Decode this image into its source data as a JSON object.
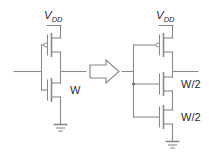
{
  "figure": {
    "type": "circuit-diagram",
    "background_color": "#ffffff",
    "wire_color": "#8a8a8a",
    "text_color": "#2b2b2b"
  },
  "left_circuit": {
    "name": "inverter-single-nmos",
    "supply_label": "V",
    "supply_subscript": "DD",
    "pmos": {
      "name": "pmos-transistor",
      "gate_bubble": true,
      "width_label": ""
    },
    "nmos": [
      {
        "name": "nmos-transistor",
        "width_label": "W"
      }
    ],
    "ground": {
      "name": "ground-symbol",
      "bars": 3
    },
    "input_terminal": "",
    "output_terminal": ""
  },
  "transform_arrow": {
    "name": "implies-arrow",
    "direction": "right",
    "style": "hollow-block"
  },
  "right_circuit": {
    "name": "inverter-stacked-nmos",
    "supply_label": "V",
    "supply_subscript": "DD",
    "pmos": {
      "name": "pmos-transistor",
      "gate_bubble": true,
      "width_label": ""
    },
    "nmos": [
      {
        "name": "nmos-transistor-upper",
        "width_label": "W/2"
      },
      {
        "name": "nmos-transistor-lower",
        "width_label": "W/2"
      }
    ],
    "ground": {
      "name": "ground-symbol",
      "bars": 3
    },
    "input_terminal": "",
    "output_terminal": ""
  }
}
